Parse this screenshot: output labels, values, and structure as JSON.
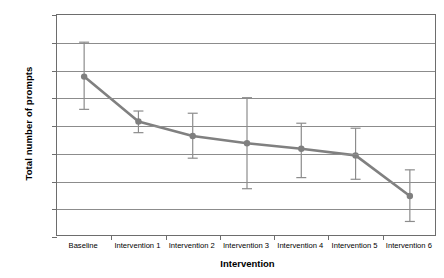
{
  "chart_data": {
    "type": "line",
    "title": "",
    "xlabel": "Intervention",
    "ylabel": "Total number of prompts",
    "categories": [
      "Baseline",
      "Intervention 1",
      "Intervention 2",
      "Intervention 3",
      "Intervention 4",
      "Intervention 5",
      "Intervention 6"
    ],
    "values": [
      2.89,
      2.08,
      1.82,
      1.69,
      1.59,
      1.47,
      0.74
    ],
    "error_upper": [
      3.51,
      2.27,
      2.23,
      2.51,
      2.05,
      1.96,
      1.21
    ],
    "error_lower": [
      2.3,
      1.88,
      1.42,
      0.87,
      1.07,
      1.04,
      0.28
    ],
    "series": [
      {
        "name": "Total number of prompts",
        "values": [
          2.89,
          2.08,
          1.82,
          1.69,
          1.59,
          1.47,
          0.74
        ],
        "error_upper": [
          3.51,
          2.27,
          2.23,
          2.51,
          2.05,
          1.96,
          1.21
        ],
        "error_lower": [
          2.3,
          1.88,
          1.42,
          0.87,
          1.07,
          1.04,
          0.28
        ]
      }
    ],
    "ylim": [
      0,
      4
    ],
    "yticks": [
      0,
      0.5,
      1,
      1.5,
      2,
      2.5,
      3,
      3.5,
      4
    ],
    "ytick_labels": [
      "0",
      "0.5",
      "1",
      "1.5",
      "2",
      "2.5",
      "3",
      "3.5",
      "4"
    ],
    "grid": "horizontal",
    "legend": "none",
    "colors": {
      "series_line": "#808080",
      "marker": "#7f7f7f",
      "error_bar": "#8c8c8c",
      "gridline": "#8c8c8c",
      "axis": "#6d6d6d",
      "text": "#000000",
      "background": "#ffffff"
    }
  }
}
